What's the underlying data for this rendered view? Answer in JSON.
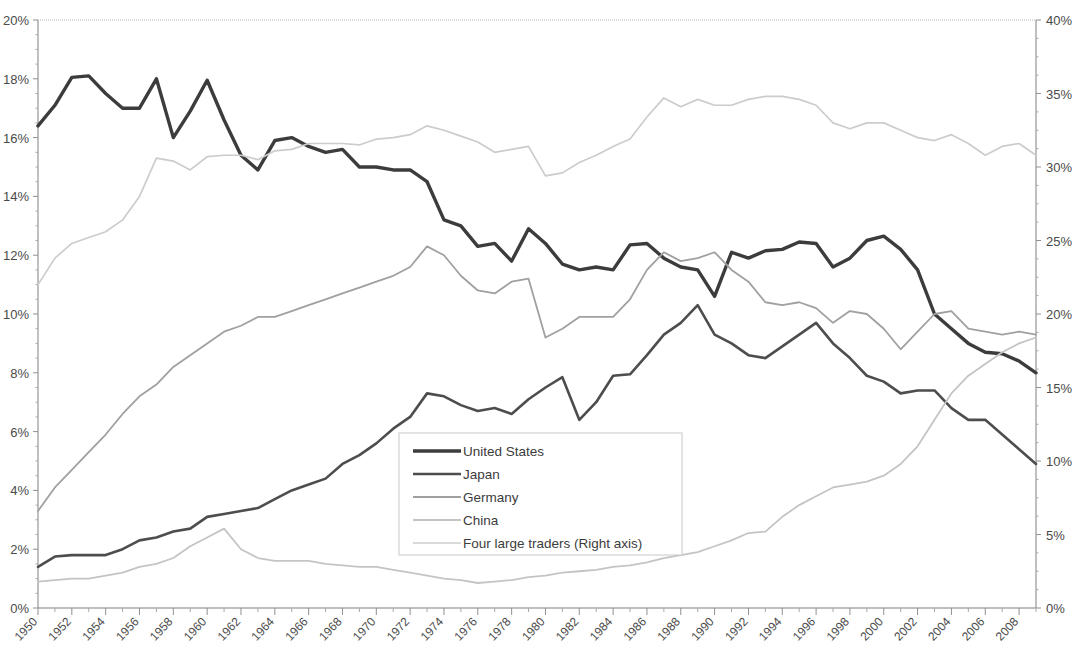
{
  "chart_data": {
    "type": "line",
    "title": "",
    "subtitle": "",
    "xlabel": "",
    "ylabel": "",
    "y2label": "",
    "grid": false,
    "legend_position": "center",
    "x_start": 1950,
    "x_end": 2009,
    "xlim": [
      1950,
      2009
    ],
    "ylim": [
      0,
      20
    ],
    "y2lim": [
      0,
      40
    ],
    "y_ticks": [
      "0%",
      "2%",
      "4%",
      "6%",
      "8%",
      "10%",
      "12%",
      "14%",
      "16%",
      "18%",
      "20%"
    ],
    "y_tick_values": [
      0,
      2,
      4,
      6,
      8,
      10,
      12,
      14,
      16,
      18,
      20
    ],
    "y2_ticks": [
      "0%",
      "5%",
      "10%",
      "15%",
      "20%",
      "25%",
      "30%",
      "35%",
      "40%"
    ],
    "y2_tick_values": [
      0,
      5,
      10,
      15,
      20,
      25,
      30,
      35,
      40
    ],
    "x_ticks": [
      "1950",
      "1952",
      "1954",
      "1956",
      "1958",
      "1960",
      "1962",
      "1964",
      "1966",
      "1968",
      "1970",
      "1972",
      "1974",
      "1976",
      "1978",
      "1980",
      "1982",
      "1984",
      "1986",
      "1988",
      "1990",
      "1992",
      "1994",
      "1996",
      "1998",
      "2000",
      "2002",
      "2004",
      "2006",
      "2008"
    ],
    "x_tick_values": [
      1950,
      1952,
      1954,
      1956,
      1958,
      1960,
      1962,
      1964,
      1966,
      1968,
      1970,
      1972,
      1974,
      1976,
      1978,
      1980,
      1982,
      1984,
      1986,
      1988,
      1990,
      1992,
      1994,
      1996,
      1998,
      2000,
      2002,
      2004,
      2006,
      2008
    ],
    "series": [
      {
        "name": "United States",
        "legend_label": "United States",
        "axis": "left",
        "color": "#3c3c3c",
        "width": 3.4,
        "values": [
          16.4,
          17.1,
          18.05,
          18.1,
          17.5,
          17.0,
          17.0,
          18.0,
          16.0,
          16.9,
          17.95,
          16.6,
          15.4,
          14.9,
          15.9,
          16.0,
          15.7,
          15.5,
          15.6,
          15.0,
          15.0,
          14.9,
          14.9,
          14.5,
          13.2,
          13.0,
          12.3,
          12.4,
          11.8,
          12.9,
          12.4,
          11.7,
          11.5,
          11.6,
          11.5,
          12.35,
          12.4,
          11.9,
          11.6,
          11.5,
          10.6,
          12.1,
          11.9,
          12.15,
          12.2,
          12.45,
          12.4,
          11.6,
          11.9,
          12.5,
          12.65,
          12.2,
          11.5,
          10.0,
          9.5,
          9.0,
          8.7,
          8.65,
          8.4,
          8.0
        ]
      },
      {
        "name": "Japan",
        "legend_label": "Japan",
        "axis": "left",
        "color": "#4d4d4d",
        "width": 2.6,
        "values": [
          1.4,
          1.75,
          1.8,
          1.8,
          1.8,
          2.0,
          2.3,
          2.4,
          2.6,
          2.7,
          3.1,
          3.2,
          3.3,
          3.4,
          3.7,
          4.0,
          4.2,
          4.4,
          4.9,
          5.2,
          5.6,
          6.1,
          6.5,
          7.3,
          7.2,
          6.9,
          6.7,
          6.8,
          6.6,
          7.1,
          7.5,
          7.85,
          6.4,
          7.0,
          7.9,
          7.95,
          8.6,
          9.3,
          9.7,
          10.3,
          9.3,
          9.0,
          8.6,
          8.5,
          8.9,
          9.3,
          9.7,
          9.0,
          8.5,
          7.9,
          7.7,
          7.3,
          7.4,
          7.4,
          6.8,
          6.4,
          6.4,
          5.9,
          5.4,
          4.9
        ]
      },
      {
        "name": "Germany",
        "legend_label": "Germany",
        "axis": "left",
        "color": "#a0a0a0",
        "width": 1.8,
        "values": [
          3.3,
          4.1,
          4.7,
          5.3,
          5.9,
          6.6,
          7.2,
          7.6,
          8.2,
          8.6,
          9.0,
          9.4,
          9.6,
          9.9,
          9.9,
          10.1,
          10.3,
          10.5,
          10.7,
          10.9,
          11.1,
          11.3,
          11.6,
          12.3,
          12.0,
          11.3,
          10.8,
          10.7,
          11.1,
          11.2,
          9.2,
          9.5,
          9.9,
          9.9,
          9.9,
          10.5,
          11.5,
          12.1,
          11.8,
          11.9,
          12.1,
          11.5,
          11.1,
          10.4,
          10.3,
          10.4,
          10.2,
          9.7,
          10.1,
          10.0,
          9.5,
          8.8,
          9.4,
          10.0,
          10.1,
          9.5,
          9.4,
          9.3,
          9.4,
          9.3
        ]
      },
      {
        "name": "China",
        "legend_label": "China",
        "axis": "left",
        "color": "#c4c4c4",
        "width": 1.8,
        "values": [
          0.9,
          0.95,
          1.0,
          1.0,
          1.1,
          1.2,
          1.4,
          1.5,
          1.7,
          2.1,
          2.4,
          2.7,
          2.0,
          1.7,
          1.6,
          1.6,
          1.6,
          1.5,
          1.45,
          1.4,
          1.4,
          1.3,
          1.2,
          1.1,
          1.0,
          0.95,
          0.85,
          0.9,
          0.95,
          1.05,
          1.1,
          1.2,
          1.25,
          1.3,
          1.4,
          1.45,
          1.55,
          1.7,
          1.8,
          1.9,
          2.1,
          2.3,
          2.55,
          2.6,
          3.1,
          3.5,
          3.8,
          4.1,
          4.2,
          4.3,
          4.5,
          4.9,
          5.5,
          6.4,
          7.3,
          7.9,
          8.3,
          8.7,
          9.0,
          9.2
        ]
      },
      {
        "name": "Four large traders",
        "legend_label": "Four large traders (Right axis)",
        "axis": "right",
        "color": "#cccccc",
        "width": 1.7,
        "values": [
          22.0,
          23.8,
          24.8,
          25.2,
          25.6,
          26.4,
          28.0,
          30.6,
          30.4,
          29.8,
          30.7,
          30.8,
          30.8,
          30.5,
          31.1,
          31.2,
          31.6,
          31.6,
          31.6,
          31.5,
          31.9,
          32.0,
          32.2,
          32.8,
          32.5,
          32.1,
          31.7,
          31.0,
          31.2,
          31.4,
          29.4,
          29.6,
          30.3,
          30.8,
          31.4,
          31.9,
          33.4,
          34.7,
          34.1,
          34.6,
          34.2,
          34.2,
          34.6,
          34.8,
          34.8,
          34.6,
          34.2,
          33.0,
          32.6,
          33.0,
          33.0,
          32.5,
          32.0,
          31.8,
          32.2,
          31.6,
          30.8,
          31.4,
          31.6,
          30.8
        ]
      }
    ]
  },
  "legend": {
    "entries": [
      {
        "label": "United States"
      },
      {
        "label": "Japan"
      },
      {
        "label": "Germany"
      },
      {
        "label": "China"
      },
      {
        "label": "Four large traders (Right axis)"
      }
    ]
  }
}
